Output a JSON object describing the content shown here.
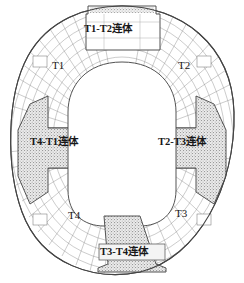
{
  "figure": {
    "kind": "architectural-floor-plan",
    "background_color": "#ffffff",
    "line_color": "#6e6e6e",
    "heavy_line_color": "#3a3a3a",
    "hatch_color": "#8a8a8a",
    "text_color": "#171717"
  },
  "towers": [
    {
      "id": "t1",
      "label": "T1",
      "position": "upper-left",
      "x": 58,
      "y": 66
    },
    {
      "id": "t2",
      "label": "T2",
      "position": "upper-right",
      "x": 183,
      "y": 66
    },
    {
      "id": "t3",
      "label": "T3",
      "position": "lower-right",
      "x": 180,
      "y": 214
    },
    {
      "id": "t4",
      "label": "T4",
      "position": "lower-left",
      "x": 73,
      "y": 216
    }
  ],
  "links": [
    {
      "id": "t1-t2",
      "label": "T1-T2连体",
      "position": "top",
      "shaded": false,
      "x": 122,
      "y": 30
    },
    {
      "id": "t2-t3",
      "label": "T2-T3连体",
      "position": "right",
      "shaded": true,
      "x": 194,
      "y": 141
    },
    {
      "id": "t4-t1",
      "label": "T4-T1连体",
      "position": "left",
      "shaded": true,
      "x": 66,
      "y": 143
    },
    {
      "id": "t3-t4",
      "label": "T3-T4连体",
      "position": "bottom",
      "shaded": true,
      "x": 133,
      "y": 253
    }
  ]
}
